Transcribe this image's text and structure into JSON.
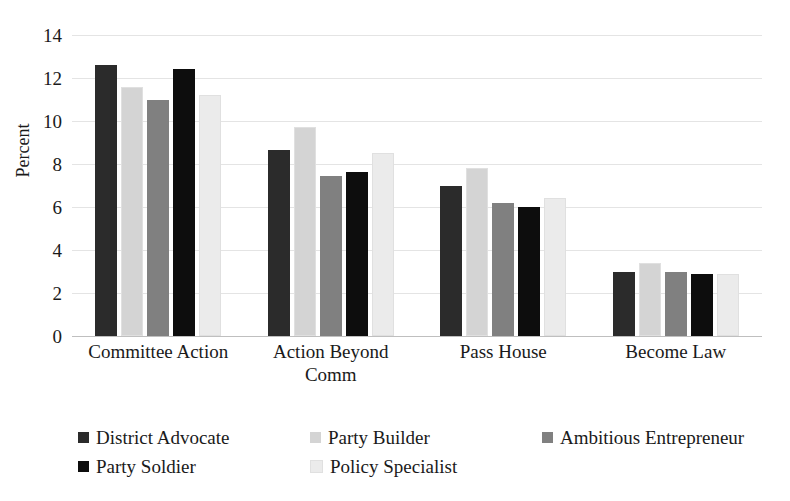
{
  "chart_data": {
    "type": "bar",
    "title": "",
    "xlabel": "",
    "ylabel": "Percent",
    "ylim": [
      0,
      14
    ],
    "ytick_step": 2,
    "yticks": [
      14,
      12,
      10,
      8,
      6,
      4,
      2,
      0
    ],
    "grid": true,
    "legend_position": "bottom",
    "categories": [
      "Committee Action",
      "Action Beyond Comm",
      "Pass House",
      "Become Law"
    ],
    "series": [
      {
        "name": "District Advocate",
        "color": "#2b2b2b",
        "values": [
          12.6,
          8.65,
          7.0,
          3.0
        ]
      },
      {
        "name": "Party Builder",
        "color": "#d4d4d4",
        "values": [
          11.6,
          9.7,
          7.8,
          3.4
        ]
      },
      {
        "name": "Ambitious Entrepreneur",
        "color": "#808080",
        "values": [
          11.0,
          7.45,
          6.2,
          3.0
        ]
      },
      {
        "name": "Party Soldier",
        "color": "#0d0d0d",
        "values": [
          12.4,
          7.65,
          6.0,
          2.9
        ]
      },
      {
        "name": "Policy Specialist",
        "color": "#ebebeb",
        "values": [
          11.2,
          8.5,
          6.4,
          2.9
        ]
      }
    ]
  },
  "axis": {
    "y_title": "Percent"
  },
  "colors": {
    "gridline": "#e4e4e4",
    "baseline": "#bfbfbf",
    "text": "#1a1a1a",
    "background": "#ffffff"
  }
}
